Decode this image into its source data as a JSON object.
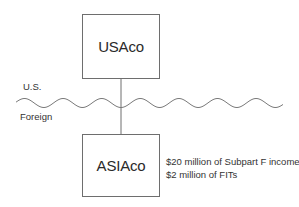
{
  "diagram": {
    "entities": [
      {
        "id": "usaco",
        "label": "USAco",
        "box": {
          "x": 82,
          "y": 14,
          "w": 78,
          "h": 65
        }
      },
      {
        "id": "asiaco",
        "label": "ASIAco",
        "box": {
          "x": 82,
          "y": 134,
          "w": 78,
          "h": 63
        }
      }
    ],
    "connector": {
      "from": "usaco",
      "to": "asiaco",
      "x": 121,
      "y1": 79,
      "y2": 134
    },
    "border": {
      "type": "wavy-line",
      "x_start": 16,
      "x_end": 283,
      "y_mid": 103,
      "amplitude": 4.5,
      "period": 38.6,
      "upper_label": "U.S.",
      "lower_label": "Foreign"
    },
    "annotations": {
      "asiaco": [
        "$20 million of Subpart F income",
        "$2 million of FITs"
      ]
    },
    "colors": {
      "line": "#6e6e6e",
      "text": "#333333",
      "background": "#ffffff"
    }
  }
}
